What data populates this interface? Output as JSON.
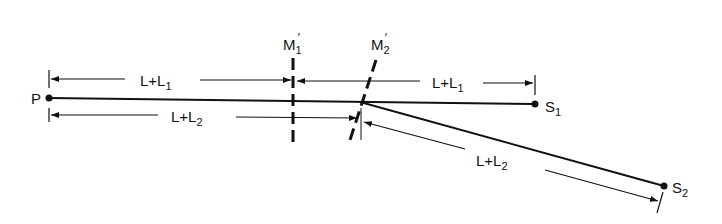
{
  "diagram": {
    "points": {
      "P": "P",
      "S1_main": "S",
      "S1_sub": "1",
      "S2_main": "S",
      "S2_sub": "2"
    },
    "mirrors": {
      "M1_main": "M",
      "M1_sub": "1",
      "M1_prime": "′",
      "M2_main": "M",
      "M2_sub": "2",
      "M2_prime": "′"
    },
    "dimensions": {
      "top_left": {
        "main": "L+L",
        "sub": "1"
      },
      "top_right": {
        "main": "L+L",
        "sub": "1"
      },
      "bottom_left": {
        "main": "L+L",
        "sub": "2"
      },
      "diagonal": {
        "main": "L+L",
        "sub": "2"
      }
    },
    "colors": {
      "ink": "#111111",
      "background": "#ffffff"
    }
  }
}
